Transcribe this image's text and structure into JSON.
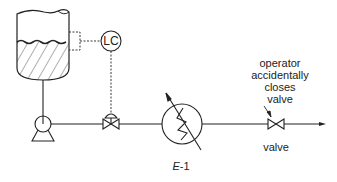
{
  "diagram": {
    "controller_label": "LC",
    "annotation": "operator\naccidentally\ncloses\nvalve",
    "annotation_lines": [
      "operator",
      "accidentally",
      "closes",
      "valve"
    ],
    "valve_label": "valve",
    "exchanger_label_italic": "E",
    "exchanger_label_suffix": "-1"
  }
}
